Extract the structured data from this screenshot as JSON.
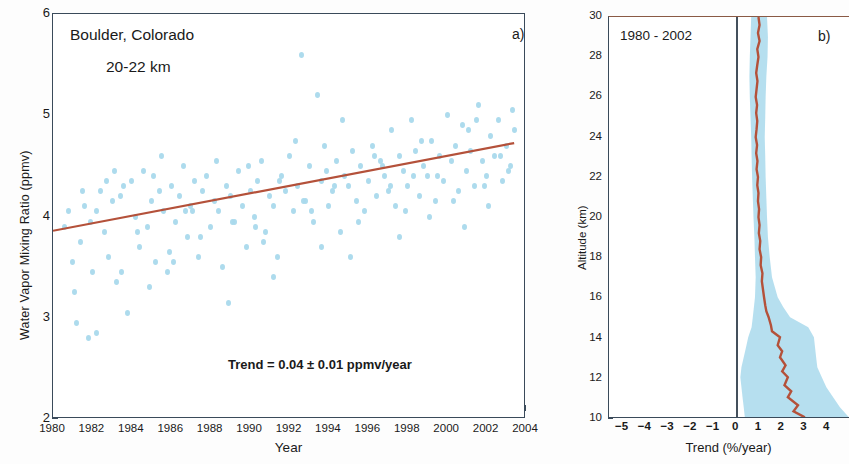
{
  "figure": {
    "panel_a_tag": "a)",
    "panel_b_tag": "b)"
  },
  "panel_a": {
    "site_label": "Boulder, Colorado",
    "altitude_label": "20-22 km",
    "trend_label": "Trend = 0.04 ± 0.01 ppmv/year",
    "xlabel": "Year",
    "ylabel": "Water Vapor Mixing Ratio (ppmv)",
    "xticks": [
      "1980",
      "1982",
      "1984",
      "1986",
      "1988",
      "1990",
      "1992",
      "1994",
      "1996",
      "1998",
      "2000",
      "2002",
      "2004"
    ],
    "yticks": [
      "2",
      "3",
      "4",
      "5",
      "6"
    ]
  },
  "panel_b": {
    "period_label": "1980 - 2002",
    "xlabel": "Trend (%/year)",
    "ylabel": "Altitude (km)",
    "xticks": [
      "−5",
      "−4",
      "−3",
      "−2",
      "−1",
      "0",
      "1",
      "2",
      "3",
      "4"
    ],
    "yticks": [
      "10",
      "12",
      "14",
      "16",
      "18",
      "20",
      "22",
      "24",
      "26",
      "28",
      "30"
    ]
  },
  "colors": {
    "scatter": "#a9d9ec",
    "trend_line": "#b4513a",
    "band": "#a9d9ec",
    "axis": "#3a4a5a",
    "zero_line": "#44505c"
  },
  "chart_data": [
    {
      "type": "scatter",
      "panel": "a",
      "title": "Boulder, Colorado 20-22 km",
      "xlabel": "Year",
      "ylabel": "Water Vapor Mixing Ratio (ppmv)",
      "xlim": [
        1980,
        2004
      ],
      "ylim": [
        2,
        6
      ],
      "grid": false,
      "legend": "none",
      "annotations": [
        "Boulder, Colorado",
        "20-22 km",
        "Trend = 0.04 ± 0.01 ppmv/year",
        "a)"
      ],
      "series": [
        {
          "name": "Water vapor mixing ratio observations",
          "color": "#a9d9ec",
          "x": [
            1980.6,
            1980.8,
            1981.0,
            1981.2,
            1981.4,
            1981.6,
            1981.8,
            1982.0,
            1982.2,
            1982.4,
            1982.6,
            1982.8,
            1983.0,
            1983.2,
            1983.4,
            1983.6,
            1983.8,
            1984.0,
            1984.2,
            1984.4,
            1984.6,
            1984.8,
            1985.0,
            1985.2,
            1985.4,
            1985.6,
            1985.8,
            1986.0,
            1986.2,
            1986.4,
            1986.6,
            1986.8,
            1987.0,
            1987.2,
            1987.4,
            1987.6,
            1987.8,
            1988.0,
            1988.2,
            1988.4,
            1988.6,
            1988.8,
            1989.0,
            1989.2,
            1989.4,
            1989.6,
            1989.8,
            1990.0,
            1990.2,
            1990.4,
            1990.6,
            1990.8,
            1991.0,
            1991.2,
            1991.4,
            1991.6,
            1991.8,
            1992.0,
            1992.2,
            1992.4,
            1992.6,
            1992.8,
            1993.0,
            1993.2,
            1993.4,
            1993.6,
            1993.8,
            1994.0,
            1994.2,
            1994.4,
            1994.6,
            1994.8,
            1995.0,
            1995.2,
            1995.4,
            1995.6,
            1995.8,
            1996.0,
            1996.2,
            1996.4,
            1996.6,
            1996.8,
            1997.0,
            1997.2,
            1997.4,
            1997.6,
            1997.8,
            1998.0,
            1998.2,
            1998.4,
            1998.6,
            1998.8,
            1999.0,
            1999.2,
            1999.4,
            1999.6,
            1999.8,
            2000.0,
            2000.2,
            2000.4,
            2000.6,
            2000.8,
            2001.0,
            2001.2,
            2001.4,
            2001.6,
            2001.8,
            2002.0,
            2002.2,
            2002.4,
            2002.6,
            2002.8,
            2003.0,
            2003.2,
            2003.4,
            1981.1,
            1981.9,
            1982.7,
            1983.5,
            1984.3,
            1985.1,
            1985.9,
            1986.7,
            1987.5,
            1988.3,
            1989.1,
            1989.9,
            1990.7,
            1991.5,
            1992.3,
            1993.1,
            1993.9,
            1994.7,
            1995.5,
            1996.3,
            1997.1,
            1997.9,
            1998.7,
            1999.5,
            2000.3,
            2001.1,
            2001.9,
            2002.7,
            2003.1,
            1982.2,
            1984.9,
            1986.1,
            1988.9,
            1991.2,
            1993.6,
            1995.1,
            1997.6,
            1999.1,
            2000.9,
            2002.1,
            1981.5,
            1983.1,
            1985.5,
            1987.1,
            1990.3,
            1992.7,
            1994.3,
            1996.7,
            1998.3,
            2001.5,
            2003.3
          ],
          "y": [
            3.9,
            4.05,
            3.55,
            2.95,
            3.75,
            4.1,
            2.8,
            3.45,
            4.05,
            4.25,
            3.85,
            3.6,
            4.15,
            3.35,
            4.2,
            4.3,
            3.05,
            4.35,
            4.0,
            3.7,
            4.45,
            3.9,
            4.15,
            3.55,
            4.25,
            4.05,
            3.45,
            4.3,
            3.95,
            4.2,
            4.5,
            3.8,
            4.1,
            4.35,
            3.6,
            4.25,
            4.4,
            3.9,
            4.15,
            4.05,
            3.5,
            4.3,
            4.2,
            3.95,
            4.45,
            4.1,
            3.7,
            4.25,
            4.0,
            4.35,
            4.55,
            3.85,
            4.2,
            4.1,
            3.6,
            4.4,
            4.25,
            4.6,
            4.05,
            4.3,
            5.6,
            4.15,
            4.5,
            3.95,
            5.2,
            4.35,
            4.7,
            4.1,
            4.25,
            4.55,
            3.85,
            4.4,
            4.3,
            4.65,
            4.15,
            4.5,
            4.05,
            4.35,
            4.7,
            4.2,
            4.55,
            4.4,
            4.25,
            4.85,
            4.1,
            4.6,
            4.45,
            4.3,
            4.95,
            4.65,
            4.2,
            4.5,
            4.4,
            4.75,
            4.15,
            4.6,
            4.35,
            5.0,
            4.55,
            4.7,
            4.25,
            4.9,
            4.45,
            4.65,
            4.3,
            5.1,
            4.55,
            4.4,
            4.8,
            4.6,
            4.95,
            4.35,
            4.7,
            4.5,
            4.85,
            3.25,
            3.95,
            4.35,
            3.45,
            3.85,
            4.4,
            3.65,
            4.05,
            3.8,
            4.55,
            3.95,
            4.5,
            3.75,
            4.35,
            4.75,
            4.05,
            4.45,
            4.95,
            3.95,
            4.6,
            4.3,
            4.05,
            4.75,
            4.4,
            4.15,
            4.85,
            4.3,
            4.6,
            4.45,
            2.85,
            3.3,
            3.55,
            3.15,
            3.4,
            3.7,
            3.6,
            3.8,
            4.0,
            3.9,
            4.1,
            4.25,
            4.45,
            4.6,
            4.05,
            3.9,
            4.15,
            4.3,
            4.5,
            4.4,
            4.95,
            5.05
          ]
        },
        {
          "name": "Linear trend fit",
          "type": "line",
          "color": "#b4513a",
          "slope_ppmv_per_year": 0.04,
          "uncertainty_ppmv_per_year": 0.01,
          "x": [
            1980,
            2003.5
          ],
          "y": [
            3.85,
            4.72
          ]
        }
      ]
    },
    {
      "type": "line",
      "panel": "b",
      "title": "1980 - 2002",
      "xlabel": "Trend (%/year)",
      "ylabel": "Altitude (km)",
      "xlim": [
        -5.6,
        5.0
      ],
      "ylim": [
        10,
        30
      ],
      "grid": false,
      "legend": "none",
      "annotations": [
        "1980 - 2002",
        "b)"
      ],
      "orientation": "vertical",
      "zero_reference_line": 0,
      "series": [
        {
          "name": "Water vapor trend profile",
          "color": "#b4513a",
          "altitude_km": [
            10.0,
            10.3,
            10.6,
            11.0,
            11.3,
            11.6,
            12.0,
            12.3,
            12.6,
            13.0,
            13.3,
            13.6,
            14.0,
            14.3,
            14.6,
            15.0,
            15.3,
            15.6,
            16.0,
            16.4,
            16.8,
            17.2,
            17.6,
            18.0,
            18.4,
            18.8,
            19.2,
            19.6,
            20.0,
            20.4,
            20.8,
            21.2,
            21.6,
            22.0,
            22.4,
            22.8,
            23.2,
            23.6,
            24.0,
            24.4,
            24.8,
            25.2,
            25.6,
            26.0,
            26.4,
            26.8,
            27.2,
            27.6,
            28.0,
            28.4,
            28.8,
            29.2,
            29.6,
            30.0
          ],
          "trend_pct_per_year": [
            3.05,
            2.55,
            2.75,
            2.3,
            2.45,
            2.15,
            2.3,
            2.05,
            2.2,
            1.95,
            2.05,
            1.85,
            1.95,
            1.6,
            1.55,
            1.45,
            1.35,
            1.3,
            1.25,
            1.2,
            1.15,
            1.18,
            1.1,
            1.12,
            1.05,
            1.08,
            1.02,
            1.05,
            1.0,
            1.03,
            0.98,
            1.0,
            0.95,
            0.98,
            0.92,
            0.96,
            0.9,
            0.94,
            0.88,
            0.92,
            0.95,
            0.9,
            0.94,
            0.88,
            0.92,
            0.96,
            0.9,
            0.95,
            1.0,
            0.95,
            1.05,
            0.98,
            1.05,
            1.0
          ]
        },
        {
          "name": "Uncertainty band (2σ)",
          "color": "#a9d9ec",
          "altitude_km": [
            10.0,
            10.5,
            11.0,
            11.5,
            12.0,
            12.5,
            13.0,
            13.5,
            14.0,
            14.5,
            15.0,
            15.5,
            16.0,
            17.0,
            18.0,
            19.0,
            20.0,
            21.0,
            22.0,
            23.0,
            24.0,
            25.0,
            26.0,
            27.0,
            28.0,
            29.0,
            30.0
          ],
          "lower_pct_per_year": [
            0.4,
            0.35,
            0.3,
            0.25,
            0.2,
            0.25,
            0.35,
            0.45,
            0.55,
            0.7,
            0.75,
            0.8,
            0.85,
            0.88,
            0.85,
            0.82,
            0.78,
            0.75,
            0.72,
            0.7,
            0.68,
            0.65,
            0.62,
            0.6,
            0.62,
            0.65,
            0.68
          ],
          "upper_pct_per_year": [
            5.0,
            4.6,
            4.3,
            4.0,
            3.8,
            3.6,
            3.55,
            3.5,
            3.45,
            3.2,
            2.4,
            2.1,
            1.85,
            1.6,
            1.5,
            1.42,
            1.38,
            1.35,
            1.32,
            1.3,
            1.28,
            1.3,
            1.32,
            1.35,
            1.4,
            1.42,
            1.38
          ]
        }
      ]
    }
  ]
}
